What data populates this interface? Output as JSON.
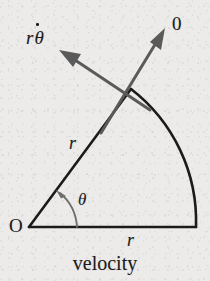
{
  "figure": {
    "caption": "velocity",
    "background_color": "#ecebe9",
    "ink_color": "#1b1b1b",
    "vector_color": "#5a5a5a",
    "labels": {
      "origin": "O",
      "radial_r": "r",
      "baseline_r": "r",
      "angle": "θ",
      "tangential_vector": {
        "coefficient": "r",
        "symbol": "θ",
        "accent": "dot",
        "full": "rθ̇"
      },
      "radial_vector": "0"
    },
    "geometry": {
      "origin_point": [
        29,
        227
      ],
      "baseline_end": [
        196,
        227
      ],
      "radial_end": [
        130,
        90
      ],
      "radius_px": 167,
      "sector_angle_deg": 54,
      "tangential_arrow_tip": [
        60,
        50
      ],
      "radial_arrow_tip": [
        164,
        29
      ],
      "arrow_crossing_point": [
        130,
        90
      ],
      "angle_arc_start": [
        76,
        227
      ],
      "angle_arc_tip": [
        57,
        196
      ]
    }
  }
}
